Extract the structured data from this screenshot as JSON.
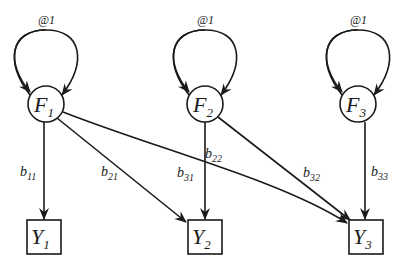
{
  "diagram": {
    "type": "path-diagram",
    "colors": {
      "stroke": "#1a1a1a",
      "background": "#ffffff"
    },
    "factors": [
      {
        "id": "F1",
        "letter": "F",
        "sub": "1",
        "variance_label": "@1"
      },
      {
        "id": "F2",
        "letter": "F",
        "sub": "2",
        "variance_label": "@1"
      },
      {
        "id": "F3",
        "letter": "F",
        "sub": "3",
        "variance_label": "@1"
      }
    ],
    "indicators": [
      {
        "id": "Y1",
        "letter": "Y",
        "sub": "1"
      },
      {
        "id": "Y2",
        "letter": "Y",
        "sub": "2"
      },
      {
        "id": "Y3",
        "letter": "Y",
        "sub": "3"
      }
    ],
    "paths": [
      {
        "from": "F1",
        "to": "Y1",
        "letter": "b",
        "sub": "11"
      },
      {
        "from": "F1",
        "to": "Y2",
        "letter": "b",
        "sub": "21"
      },
      {
        "from": "F1",
        "to": "Y3",
        "letter": "b",
        "sub": "31"
      },
      {
        "from": "F2",
        "to": "Y2",
        "letter": "b",
        "sub": "22"
      },
      {
        "from": "F2",
        "to": "Y3",
        "letter": "b",
        "sub": "32"
      },
      {
        "from": "F3",
        "to": "Y3",
        "letter": "b",
        "sub": "33"
      }
    ]
  }
}
